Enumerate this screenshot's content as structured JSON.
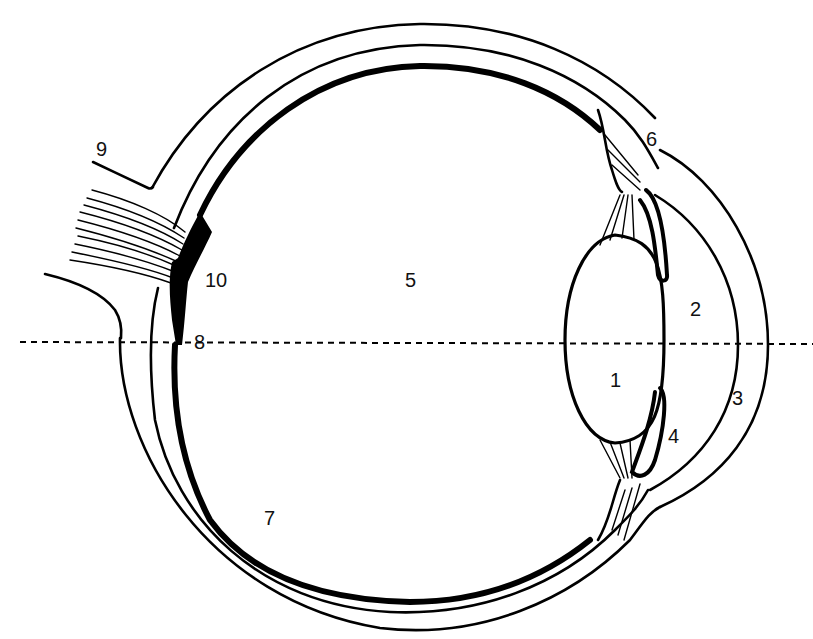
{
  "diagram": {
    "background": "#ffffff",
    "stroke_color": "#000000",
    "optical_axis": "dashed horizontal line",
    "labels": [
      {
        "id": "1",
        "text": "1",
        "x": 617,
        "y": 387
      },
      {
        "id": "2",
        "text": "2",
        "x": 697,
        "y": 316
      },
      {
        "id": "3",
        "text": "3",
        "x": 739,
        "y": 405
      },
      {
        "id": "4",
        "text": "4",
        "x": 675,
        "y": 443
      },
      {
        "id": "5",
        "text": "5",
        "x": 412,
        "y": 287
      },
      {
        "id": "6",
        "text": "6",
        "x": 654,
        "y": 146
      },
      {
        "id": "7",
        "text": "7",
        "x": 271,
        "y": 525
      },
      {
        "id": "8",
        "text": "8",
        "x": 201,
        "y": 349
      },
      {
        "id": "9",
        "text": "9",
        "x": 103,
        "y": 156
      },
      {
        "id": "10",
        "text": "10",
        "x": 217,
        "y": 287
      }
    ]
  }
}
